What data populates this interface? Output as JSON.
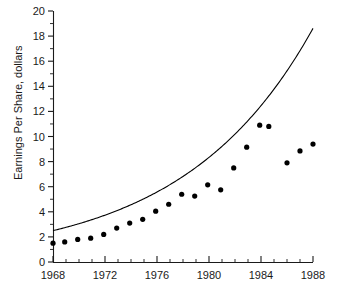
{
  "chart_data": {
    "type": "scatter",
    "title": "",
    "xlabel": "",
    "ylabel": "Earnings Per Share, dollars",
    "xlim": [
      1968,
      1988
    ],
    "ylim": [
      0,
      20
    ],
    "grid": false,
    "legend": "none",
    "x_ticks": [
      1968,
      1972,
      1976,
      1980,
      1984,
      1988
    ],
    "x_tick_labels": [
      "1968",
      "1972",
      "1976",
      "1980",
      "1984",
      "1988"
    ],
    "x_minor_tick_step": 1,
    "y_ticks": [
      0,
      2,
      4,
      6,
      8,
      10,
      12,
      14,
      16,
      18,
      20
    ],
    "y_tick_labels": [
      "0",
      "2",
      "4",
      "6",
      "8",
      "10",
      "12",
      "14",
      "16",
      "18",
      "20"
    ],
    "y_minor_tick_step": 1,
    "series": [
      {
        "name": "Earnings Per Share",
        "type": "scatter",
        "marker": "filled-circle",
        "color": "#000000",
        "x": [
          1968,
          1968.9,
          1969.9,
          1970.9,
          1971.9,
          1972.9,
          1973.9,
          1974.9,
          1975.9,
          1976.9,
          1977.9,
          1978.9,
          1979.9,
          1980.9,
          1981.9,
          1982.9,
          1983.9,
          1984.6,
          1986.0,
          1987.0,
          1988.0
        ],
        "y": [
          1.5,
          1.6,
          1.8,
          1.9,
          2.2,
          2.7,
          3.1,
          3.4,
          4.05,
          4.6,
          5.4,
          5.25,
          6.15,
          5.75,
          7.5,
          9.15,
          10.9,
          10.8,
          7.9,
          8.85,
          9.4
        ]
      },
      {
        "name": "Exponential trend fit",
        "type": "line",
        "color": "#000000",
        "x": [
          1968,
          1969,
          1970,
          1971,
          1972,
          1973,
          1974,
          1975,
          1976,
          1977,
          1978,
          1979,
          1980,
          1981,
          1982,
          1983,
          1984,
          1985,
          1986,
          1987,
          1988
        ],
        "y": [
          1.5,
          1.65,
          1.83,
          2.02,
          2.24,
          2.47,
          2.73,
          3.02,
          3.34,
          3.69,
          4.09,
          4.52,
          5.0,
          5.53,
          6.11,
          6.76,
          7.47,
          8.26,
          9.14,
          10.11,
          11.18
        ]
      }
    ]
  },
  "axes": {
    "y_title": "Earnings Per Share, dollars"
  }
}
